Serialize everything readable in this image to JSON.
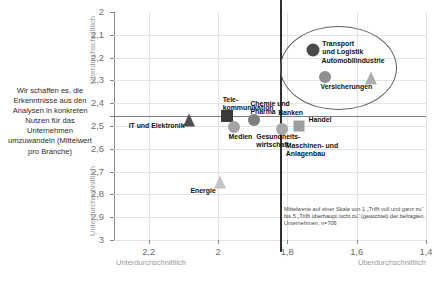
{
  "caption": {
    "text": "Wir schaffen es, die Erkenntnisse aus den Analysen in konkreten Nutzen für das Unternehmen umzuwandeln (Mittelwert pro Branche)"
  },
  "footnote": {
    "text": "Mittelwerte auf einer Skala von 1 „Trifft voll und ganz zu“ bis 5 „Trifft überhaupt nicht zu“ (gewichtet) der befragten Unternehmen, n=706"
  },
  "axes": {
    "y_top_label": "Überdurchschnittlich",
    "y_bottom_label": "Unterdurchschnittlich",
    "x_left_label": "Unterdurchschnittlich",
    "x_right_label": "Überdurchschnittlich",
    "y_ticks": [
      "2",
      "2,1",
      "2,2",
      "2,3",
      "2,4",
      "2,5",
      "2,6",
      "2,7",
      "2,8",
      "2,9",
      "3"
    ],
    "x_ticks": [
      "2,2",
      "2",
      "1,8",
      "1,6",
      "1,4"
    ]
  },
  "chart_data": {
    "type": "scatter",
    "title": "Wir schaffen es, die Erkenntnisse aus den Analysen in konkreten Nutzen für das Unternehmen umzuwandeln (Mittelwert pro Branche)",
    "xlabel": "Unterdurchschnittlich / Überdurchschnittlich",
    "ylabel": "Überdurchschnittlich / Unterdurchschnittlich",
    "xlim": [
      2.3,
      1.4
    ],
    "ylim": [
      2.0,
      3.0
    ],
    "x_reversed": true,
    "y_reversed": true,
    "grid": true,
    "legend": "none",
    "scale_note": "Mittelwerte auf einer Skala von 1 „Trifft voll und ganz zu“ bis 5 „Trifft überhaupt nicht zu“ (gewichtet) der befragten Unternehmen, n=706",
    "crosshair": {
      "x": 1.82,
      "y": 2.455
    },
    "highlight_ellipse": {
      "label": "Top-Branchen",
      "cx": 1.655,
      "cy": 2.24,
      "rx": 0.165,
      "ry": 0.18
    },
    "points": [
      {
        "label": "IT und Elektronik",
        "x": 2.085,
        "y": 2.475,
        "marker": "triangle",
        "color": "#4f4f4f",
        "size": 13,
        "label_pos": "left"
      },
      {
        "label": "Tele-\nkommunikation",
        "x": 1.975,
        "y": 2.455,
        "marker": "square",
        "color": "#3a3a3a",
        "size": 12,
        "label_pos": "top"
      },
      {
        "label": "Medien",
        "x": 1.955,
        "y": 2.505,
        "marker": "circle",
        "color": "#a3a3a3",
        "size": 12,
        "label_pos": "bottom"
      },
      {
        "label": "Chemie und\nPharma",
        "x": 1.895,
        "y": 2.475,
        "marker": "circle",
        "color": "#7d7d7d",
        "size": 12,
        "label_pos": "top"
      },
      {
        "label": "Gesundheits-\nwirtschaft",
        "x": 1.875,
        "y": 2.505,
        "marker": "none",
        "color": "#999999",
        "size": 0,
        "label_pos": "bottom"
      },
      {
        "label": "Banken",
        "x": 1.815,
        "y": 2.515,
        "marker": "circle",
        "color": "#a8a8a8",
        "size": 12,
        "label_pos": "top"
      },
      {
        "label": "Handel",
        "x": 1.765,
        "y": 2.5,
        "marker": "square",
        "color": "#9e9e9e",
        "size": 11,
        "label_pos": "right"
      },
      {
        "label": "Maschinen- und\nAnlagenbau",
        "x": 1.79,
        "y": 2.545,
        "marker": "none",
        "color": "#999999",
        "size": 0,
        "label_pos": "bottom"
      },
      {
        "label": "Energie",
        "x": 1.995,
        "y": 2.745,
        "marker": "triangle",
        "color": "#c4c4c4",
        "size": 13,
        "label_pos": "bottomleft"
      },
      {
        "label": "Transport\nund Logistik",
        "x": 1.725,
        "y": 2.165,
        "marker": "circle",
        "color": "#4a4a4a",
        "size": 13,
        "label_pos": "right"
      },
      {
        "label": "Automobilindustrie",
        "x": 1.69,
        "y": 2.285,
        "marker": "circle",
        "color": "#8f8f8f",
        "size": 12,
        "label_pos": "top"
      },
      {
        "label": "Versicherungen",
        "x": 1.56,
        "y": 2.29,
        "marker": "triangle",
        "color": "#adadad",
        "size": 13,
        "label_pos": "bottomleft"
      }
    ]
  }
}
